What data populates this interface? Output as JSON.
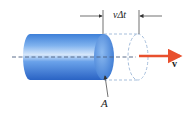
{
  "figure": {
    "labels": {
      "displacement": "vΔt",
      "velocity": "v",
      "area": "A"
    },
    "colors": {
      "cylinder_body": "#4a8fe0",
      "cylinder_highlight": "#cfe2fa",
      "cylinder_dark": "#2a63c4",
      "end_cap": "#6aa4ea",
      "dashed_outline": "#9db8d8",
      "axis_line": "#4a5f80",
      "velocity_arrow": "#e8502e",
      "dimension_lines": "#333333"
    }
  }
}
